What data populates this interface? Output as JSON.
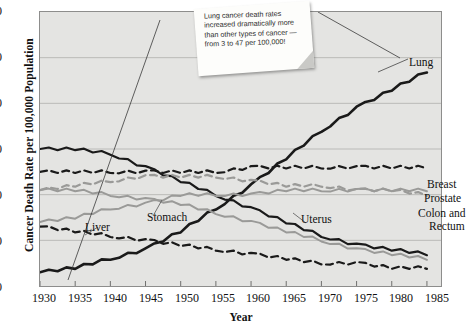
{
  "chart_data": {
    "type": "line",
    "title": "",
    "xlabel": "Year",
    "ylabel": "Cancer Death Rate per 100,000 Population",
    "xlim": [
      1930,
      1987
    ],
    "ylim": [
      0,
      60
    ],
    "yticks": [
      0,
      10,
      20,
      30,
      40,
      50,
      60
    ],
    "xticks": [
      1930,
      1935,
      1940,
      1945,
      1950,
      1955,
      1960,
      1965,
      1970,
      1975,
      1980,
      1985
    ],
    "grid": "horizontal",
    "legend_position": "inline-labels",
    "annotation": "Lung cancer death rates increased dramatically more than other types of cancer — from 3 to 47 per 100,000!",
    "x": [
      1930,
      1935,
      1940,
      1945,
      1950,
      1955,
      1960,
      1965,
      1970,
      1975,
      1980,
      1985
    ],
    "series": [
      {
        "name": "Lung",
        "style": "solid",
        "color": "#1a1a1a",
        "width": 2.6,
        "values": [
          3,
          4,
          6,
          8,
          12,
          17,
          22,
          28,
          34,
          39,
          43,
          47
        ]
      },
      {
        "name": "Stomach",
        "style": "solid",
        "color": "#1a1a1a",
        "width": 2.2,
        "values": [
          30,
          30,
          29,
          26,
          23,
          20,
          17,
          14,
          11,
          9,
          8,
          7
        ]
      },
      {
        "name": "Breast",
        "style": "dashed",
        "color": "#1a1a1a",
        "width": 2.2,
        "values": [
          25,
          25,
          25,
          25,
          25,
          25,
          26,
          26,
          26,
          26,
          26,
          26
        ]
      },
      {
        "name": "Colon and Rectum",
        "style": "dashed",
        "color": "#9a9a98",
        "width": 2.2,
        "values": [
          21,
          22,
          23,
          24,
          24,
          24,
          23,
          22,
          22,
          21,
          21,
          20
        ]
      },
      {
        "name": "Prostate",
        "style": "solid",
        "color": "#9a9a98",
        "width": 2.0,
        "values": [
          14,
          15,
          17,
          18,
          20,
          20,
          20,
          21,
          21,
          21,
          21,
          21
        ]
      },
      {
        "name": "Uterus",
        "style": "solid",
        "color": "#9a9a98",
        "width": 2.0,
        "values": [
          21,
          21,
          20,
          19,
          18,
          16,
          14,
          12,
          10,
          8,
          7,
          6
        ]
      },
      {
        "name": "Liver",
        "style": "dashed",
        "color": "#1a1a1a",
        "width": 2.2,
        "values": [
          13,
          12,
          11,
          10,
          9,
          8,
          7,
          6,
          5,
          5,
          4,
          4
        ]
      }
    ],
    "series_labels": [
      {
        "name": "Lung",
        "text": "Lung"
      },
      {
        "name": "Breast",
        "text": "Breast"
      },
      {
        "name": "Prostate",
        "text": "Prostate"
      },
      {
        "name": "Colon and Rectum",
        "text": "Colon and"
      },
      {
        "name": "Colon and Rectum 2",
        "text": "Rectum"
      },
      {
        "name": "Liver",
        "text": "Liver"
      },
      {
        "name": "Stomach",
        "text": "Stomach"
      },
      {
        "name": "Uterus",
        "text": "Uterus"
      }
    ]
  },
  "axes": {
    "ylabel": "Cancer Death Rate per 100,000 Population",
    "xlabel": "Year",
    "ytick_labels": [
      "60",
      "50",
      "40",
      "30",
      "20",
      "10",
      "0"
    ],
    "xtick_labels": [
      "1930",
      "1935",
      "1940",
      "1945",
      "1950",
      "1955",
      "1960",
      "1965",
      "1970",
      "1975",
      "1980",
      "1985"
    ]
  },
  "labels": {
    "lung": "Lung",
    "breast": "Breast",
    "prostate": "Prostate",
    "colon_1": "Colon and",
    "colon_2": "Rectum",
    "liver": "Liver",
    "stomach": "Stomach",
    "uterus": "Uterus"
  },
  "note": {
    "text": "Lung cancer death rates increased dramatically more than other types of cancer — from 3 to 47 per 100,000!"
  },
  "colors": {
    "plot_background": "#e4e4e2",
    "page_background": "#ffffff",
    "dark_series": "#1a1a1a",
    "gray_series": "#9a9a98",
    "gridline": "#b5b5b3",
    "border": "#8d8d8c"
  }
}
